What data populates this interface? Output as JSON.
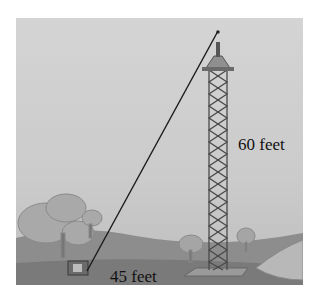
{
  "figure": {
    "labels": {
      "height": "60 feet",
      "base": "45 feet"
    },
    "colors": {
      "sky": "#d0d0d0",
      "ground": "#8a8a8a",
      "tower": "#555555",
      "wire": "#1a1a1a",
      "text": "#111111"
    }
  }
}
